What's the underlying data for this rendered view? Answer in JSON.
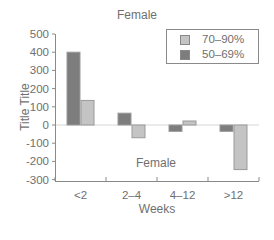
{
  "chart_data": {
    "type": "bar",
    "title": "Female",
    "annotation": "Female",
    "xlabel": "Weeks",
    "ylabel": "Title Title",
    "categories": [
      "<2",
      "2–4",
      "4–12",
      ">12"
    ],
    "series": [
      {
        "name": "50–69%",
        "color": "#7d7d7d",
        "values": [
          400,
          65,
          -35,
          -35
        ]
      },
      {
        "name": "70–90%",
        "color": "#c4c4c4",
        "values": [
          135,
          -70,
          22,
          -245
        ]
      }
    ],
    "yticks": [
      500,
      400,
      300,
      200,
      100,
      0,
      -100,
      -200,
      -300
    ],
    "ylim": [
      -300,
      500
    ],
    "grid": false,
    "zero_line": true,
    "legend_position": "upper right",
    "legend": [
      "70–90%",
      "50–69%"
    ]
  },
  "labels": {
    "title": "Female",
    "annotation": "Female",
    "xlabel": "Weeks",
    "ylabel": "Title Title",
    "legend": [
      {
        "label": "70–90%",
        "color": "#c4c4c4"
      },
      {
        "label": "50–69%",
        "color": "#7d7d7d"
      }
    ],
    "yticks": [
      "500",
      "400",
      "300",
      "200",
      "100",
      "0",
      "-100",
      "-200",
      "-300"
    ],
    "xticks": [
      "<2",
      "2–4",
      "4–12",
      ">12"
    ]
  }
}
